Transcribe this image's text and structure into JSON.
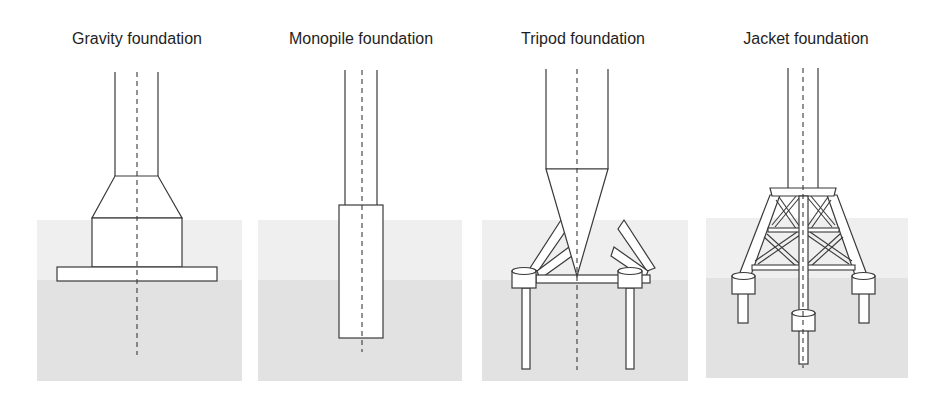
{
  "diagram": {
    "panels": [
      {
        "id": "gravity",
        "title": "Gravity foundation",
        "title_x": 137
      },
      {
        "id": "monopile",
        "title": "Monopile foundation",
        "title_x": 361
      },
      {
        "id": "tripod",
        "title": "Tripod foundation",
        "title_x": 583
      },
      {
        "id": "jacket",
        "title": "Jacket foundation",
        "title_x": 806
      }
    ],
    "colors": {
      "water": "#efefef",
      "seabed": "#e2e2e2",
      "line": "#3a3a3a",
      "fill": "#ffffff"
    }
  }
}
